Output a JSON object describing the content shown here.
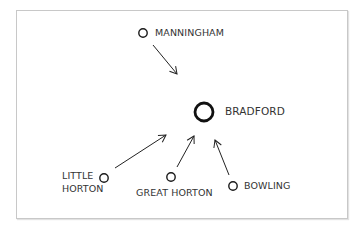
{
  "diagram": {
    "center_node": {
      "label": "BRADFORD"
    },
    "nodes": [
      {
        "id": "manningham",
        "label": "MANNINGHAM"
      },
      {
        "id": "little_horton",
        "label_line1": "LITTLE",
        "label_line2": "HORTON"
      },
      {
        "id": "great_horton",
        "label": "GREAT HORTON"
      },
      {
        "id": "bowling",
        "label": "BOWLING"
      }
    ],
    "edges": [
      {
        "from": "MANNINGHAM",
        "to": "BRADFORD"
      },
      {
        "from": "LITTLE HORTON",
        "to": "BRADFORD"
      },
      {
        "from": "GREAT HORTON",
        "to": "BRADFORD"
      },
      {
        "from": "BOWLING",
        "to": "BRADFORD"
      }
    ],
    "colors": {
      "stroke": "#1a1a1a",
      "text": "#333333",
      "border": "#c8c8c8"
    }
  }
}
